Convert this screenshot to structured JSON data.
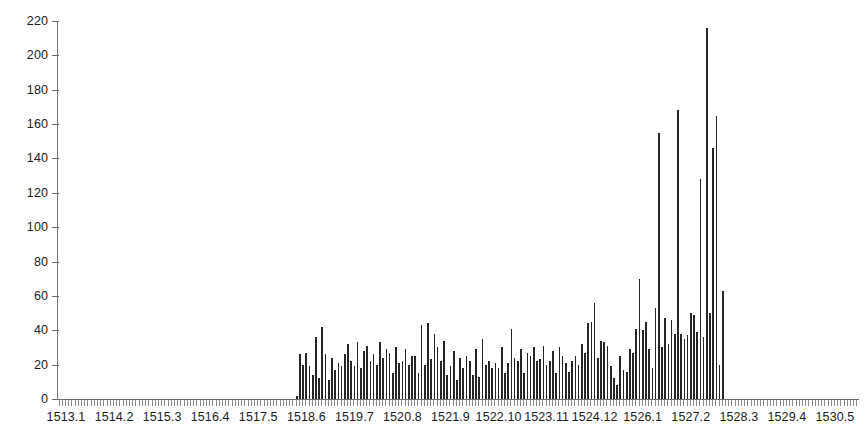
{
  "chart_data": {
    "type": "bar",
    "title": "",
    "subtitle": "",
    "xlabel": "",
    "ylabel": "",
    "ylim": [
      0,
      220
    ],
    "ytick_values": [
      0,
      20,
      40,
      60,
      80,
      100,
      120,
      140,
      160,
      180,
      200,
      220
    ],
    "ytick_labels": [
      "0",
      "20",
      "40",
      "60",
      "80",
      "100",
      "120",
      "140",
      "160",
      "180",
      "200",
      "220"
    ],
    "grid": false,
    "legend": null,
    "axis_color": "#6b6b6b",
    "bar_color": "#262626",
    "background_color": "#ffffff",
    "xtick_labels": [
      "1513.1",
      "1514.2",
      "1515.3",
      "1516.4",
      "1517.5",
      "1518.6",
      "1519.7",
      "1520.8",
      "1521.9",
      "1522.10",
      "1523.11",
      "1524.12",
      "1526.1",
      "1527.2",
      "1528.3",
      "1529.4",
      "1530.5"
    ],
    "xtick_index_positions": [
      2,
      17,
      32,
      47,
      62,
      77,
      92,
      107,
      122,
      137,
      152,
      167,
      182,
      197,
      212,
      227,
      242
    ],
    "n_bars": 250,
    "values": [
      0,
      0,
      0,
      0,
      0,
      0,
      0,
      0,
      0,
      0,
      0,
      0,
      0,
      0,
      0,
      0,
      0,
      0,
      0,
      0,
      0,
      0,
      0,
      0,
      0,
      0,
      0,
      0,
      0,
      0,
      0,
      0,
      0,
      0,
      0,
      0,
      0,
      0,
      0,
      0,
      0,
      0,
      0,
      0,
      0,
      0,
      0,
      0,
      0,
      0,
      0,
      0,
      0,
      0,
      0,
      0,
      0,
      0,
      0,
      0,
      0,
      0,
      0,
      0,
      0,
      0,
      0,
      0,
      0,
      0,
      0,
      0,
      0,
      0,
      2,
      26,
      20,
      27,
      19,
      14,
      36,
      12,
      42,
      26,
      11,
      24,
      17,
      21,
      19,
      26,
      32,
      22,
      19,
      33,
      18,
      28,
      31,
      22,
      26,
      20,
      33,
      24,
      29,
      27,
      15,
      30,
      21,
      22,
      29,
      20,
      25,
      25,
      15,
      43,
      20,
      44,
      23,
      38,
      30,
      22,
      34,
      14,
      19,
      28,
      11,
      24,
      18,
      25,
      22,
      14,
      29,
      13,
      35,
      20,
      22,
      18,
      21,
      18,
      30,
      15,
      21,
      41,
      24,
      22,
      29,
      15,
      27,
      25,
      30,
      22,
      23,
      31,
      20,
      22,
      28,
      15,
      30,
      25,
      21,
      16,
      22,
      25,
      20,
      32,
      27,
      44,
      45,
      56,
      24,
      34,
      33,
      31,
      19,
      12,
      8,
      25,
      17,
      16,
      29,
      27,
      41,
      70,
      40,
      45,
      29,
      18,
      53,
      155,
      30,
      47,
      32,
      46,
      38,
      168,
      38,
      35,
      37,
      50,
      49,
      39,
      128,
      36,
      216,
      50,
      146,
      165,
      20,
      63,
      0,
      0,
      0,
      0,
      0,
      0,
      0,
      0,
      0,
      0,
      0,
      0,
      0,
      0,
      0,
      0,
      0,
      0,
      0,
      0,
      0,
      0,
      0,
      0,
      0,
      0,
      0,
      0,
      0,
      0,
      0,
      0,
      0,
      0,
      0,
      0,
      0,
      0,
      0,
      0,
      0,
      0
    ]
  }
}
